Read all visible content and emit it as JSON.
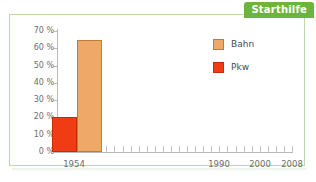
{
  "badge": {
    "label": "Starthilfe"
  },
  "colors": {
    "accent_green": "#6cb33f",
    "frame_green": "#bcd9a8",
    "bahn": "#f0a868",
    "bahn_border": "#c4793a",
    "pkw": "#f03c14",
    "pkw_border": "#c42d0c",
    "axis": "#b9b9b9",
    "tick_text": "#6d6d6d"
  },
  "legend": {
    "position": "right",
    "items": [
      {
        "label": "Bahn",
        "color": "#f0a868",
        "swatch": "bahn-swatch"
      },
      {
        "label": "Pkw",
        "color": "#f03c14",
        "swatch": "pkw-swatch"
      }
    ]
  },
  "chart_data": {
    "type": "bar",
    "title": "",
    "xlabel": "",
    "ylabel": "",
    "categories": [
      "1954"
    ],
    "series": [
      {
        "name": "Bahn",
        "values": [
          65
        ],
        "color": "#f0a868"
      },
      {
        "name": "Pkw",
        "values": [
          20
        ],
        "color": "#f03c14"
      }
    ],
    "ylim": [
      0,
      70
    ],
    "yticks": [
      0,
      10,
      20,
      30,
      40,
      50,
      60,
      70
    ],
    "ytick_labels": [
      "0 %",
      "10 %",
      "20 %",
      "30 %",
      "40 %",
      "50 %",
      "60 %",
      "70 %"
    ],
    "xlim": [
      1950,
      2008
    ],
    "xtick_labels": [
      "1954",
      "1990",
      "2000",
      "2008"
    ],
    "xtick_values": [
      1954,
      1990,
      2000,
      2008
    ],
    "grid": false,
    "minor_xticks": true
  }
}
